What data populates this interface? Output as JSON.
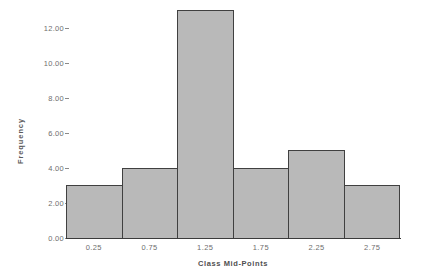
{
  "chart_data": {
    "type": "bar",
    "title": "",
    "subtitle": "",
    "xlabel": "Class Mid-Points",
    "ylabel": "Frequency",
    "categories": [
      "0.25",
      "0.75",
      "1.25",
      "1.75",
      "2.25",
      "2.75"
    ],
    "values": [
      3,
      4,
      13,
      4,
      5,
      3
    ],
    "series": [
      {
        "name": "Frequency",
        "values": [
          3,
          4,
          13,
          4,
          5,
          3
        ]
      }
    ],
    "ylim": [
      0,
      13.25
    ],
    "xlim": [
      0,
      3
    ],
    "y_ticks": [
      0,
      2,
      4,
      6,
      8,
      10,
      12
    ],
    "y_tick_labels": [
      "0.00",
      "2.00",
      "4.00",
      "6.00",
      "8.00",
      "10.00",
      "12.00"
    ],
    "x_tick_labels": [
      "0.25",
      "0.75",
      "1.25",
      "1.75",
      "2.25",
      "2.75"
    ],
    "grid": false,
    "legend": false,
    "legend_position": "none",
    "bar_fill_color": "#b9b9b9",
    "bar_edge_color": "#404040",
    "background_color": "#ffffff",
    "text_color": "#6e6e6e",
    "axis_color": "#3b3b3b"
  }
}
